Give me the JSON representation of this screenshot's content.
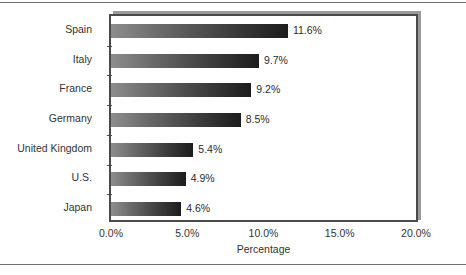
{
  "chart_data": {
    "type": "bar",
    "orientation": "horizontal",
    "title": "",
    "xlabel": "Percentage",
    "ylabel": "",
    "categories": [
      "Spain",
      "Italy",
      "France",
      "Germany",
      "United Kingdom",
      "U.S.",
      "Japan"
    ],
    "values": [
      11.6,
      9.7,
      9.2,
      8.5,
      5.4,
      4.9,
      4.6
    ],
    "value_labels": [
      "11.6%",
      "9.7%",
      "9.2%",
      "8.5%",
      "5.4%",
      "4.9%",
      "4.6%"
    ],
    "xlim": [
      0,
      20
    ],
    "xticks": [
      0,
      5,
      10,
      15,
      20
    ],
    "xtick_labels": [
      "0.0%",
      "5.0%",
      "10.0%",
      "15.0%",
      "20.0%"
    ],
    "grid": false,
    "legend": null,
    "bar_gradient_start": "#8d8d8d",
    "bar_gradient_end": "#1c1c1c",
    "frame_color": "#4a4a4a",
    "shadow_color": "#9a9a9a",
    "background": "#ffffff"
  }
}
